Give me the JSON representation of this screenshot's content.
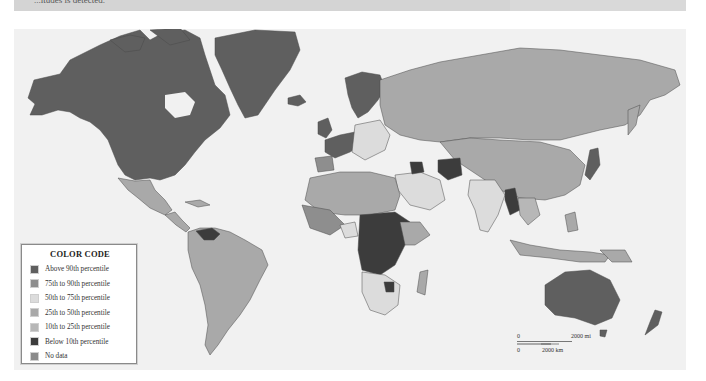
{
  "header": {
    "text": "...itudes is detected."
  },
  "map": {
    "type": "choropleth-world",
    "colors": {
      "ocean": "#f1f1f1",
      "above_90": "#5f5f5f",
      "p75_90": "#8e8e8e",
      "p50_75": "#dcdcdc",
      "p25_50": "#a9a9a9",
      "p10_25": "#b7b7b7",
      "below_10": "#3c3c3c",
      "no_data": "#8a8a8a",
      "border": "#4a4a4a"
    }
  },
  "legend": {
    "title": "COLOR CODE",
    "items": [
      {
        "label": "Above 90th percentile",
        "color": "#5f5f5f"
      },
      {
        "label": "75th to 90th percentile",
        "color": "#8e8e8e"
      },
      {
        "label": "50th to 75th percentile",
        "color": "#dcdcdc"
      },
      {
        "label": "25th to 50th percentile",
        "color": "#a9a9a9"
      },
      {
        "label": "10th to 25th percentile",
        "color": "#b7b7b7"
      },
      {
        "label": "Below 10th percentile",
        "color": "#3c3c3c"
      },
      {
        "label": "No data",
        "color": "#8a8a8a"
      }
    ]
  },
  "scale": {
    "mi_zero": "0",
    "mi_label": "2000 mi",
    "km_zero": "0",
    "km_label": "2000 km"
  }
}
